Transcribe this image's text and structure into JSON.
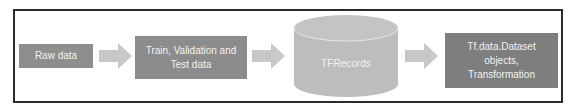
{
  "diagram": {
    "title": "",
    "nodes": [
      {
        "id": "raw",
        "label": "Raw data",
        "shape": "rectangle"
      },
      {
        "id": "split",
        "label": "Train, Validation and Test data",
        "shape": "rectangle"
      },
      {
        "id": "tfrecords",
        "label": "TFRecords",
        "shape": "cylinder"
      },
      {
        "id": "tfdata",
        "label": "Tf.data.Dataset objects, Transformation",
        "shape": "rectangle"
      }
    ],
    "edges": [
      {
        "from": "raw",
        "to": "split",
        "icon": "right-arrow-icon"
      },
      {
        "from": "split",
        "to": "tfrecords",
        "icon": "right-arrow-icon"
      },
      {
        "from": "tfrecords",
        "to": "tfdata",
        "icon": "right-arrow-icon"
      }
    ],
    "labels": {
      "raw": "Raw data",
      "split_line1": "Train, Validation and",
      "split_line2": "Test data",
      "tfrecords": "TFRecords",
      "tfdata_line1": "Tf.data.Dataset",
      "tfdata_line2": "objects,",
      "tfdata_line3": "Transformation"
    },
    "colors": {
      "box_fill": "#8a8a8a",
      "box_text": "#f2f2f2",
      "arrow_fill": "#c8c8c8",
      "cylinder_fill": "#bdbdbd",
      "frame_border": "#2b2b2b"
    }
  }
}
